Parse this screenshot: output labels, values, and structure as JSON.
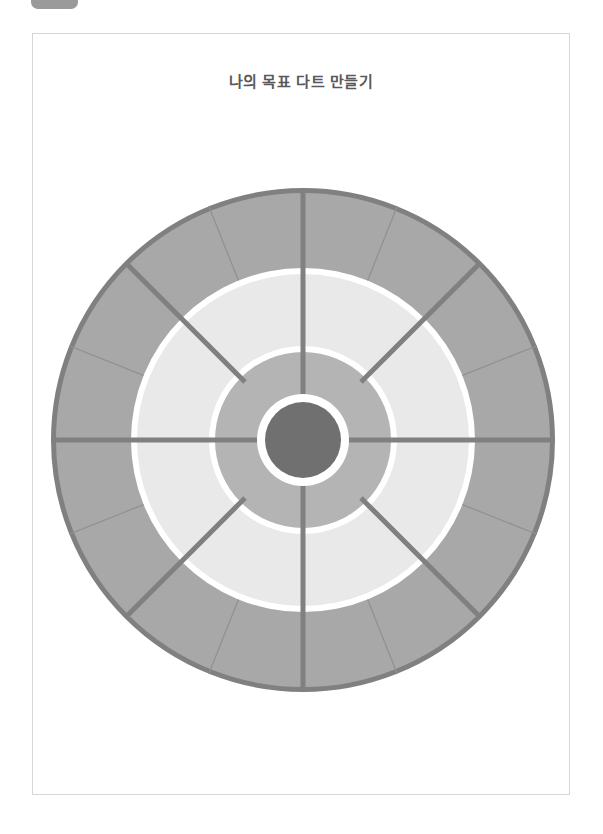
{
  "window": {
    "background_color": "#ffffff",
    "top_chrome_color": "#9a9a9a"
  },
  "page": {
    "title": "나의 목표 다트 만들기",
    "border_color": "#d6d6d6",
    "background_color": "#ffffff"
  },
  "dartboard": {
    "name": "goal-dart-target",
    "center": {
      "x": 252,
      "y": 252
    },
    "outer_radius": 252,
    "rings": [
      {
        "name": "outer-segments-ring",
        "inner_radius": 172,
        "outer_radius": 249,
        "fill": "#a8a8a8",
        "segments": 12
      },
      {
        "name": "white-separator-ring-outer",
        "inner_radius": 166,
        "outer_radius": 172,
        "fill": "#ffffff"
      },
      {
        "name": "light-ring",
        "inner_radius": 94,
        "outer_radius": 166,
        "fill": "#e9e9e9"
      },
      {
        "name": "white-separator-ring-inner",
        "inner_radius": 88,
        "outer_radius": 94,
        "fill": "#ffffff"
      },
      {
        "name": "medium-ring",
        "inner_radius": 46,
        "outer_radius": 88,
        "fill": "#b4b4b4"
      },
      {
        "name": "white-separator-ring-center",
        "inner_radius": 38,
        "outer_radius": 46,
        "fill": "#ffffff"
      },
      {
        "name": "bullseye",
        "inner_radius": 0,
        "outer_radius": 38,
        "fill": "#707070"
      }
    ],
    "outline_color": "#808080",
    "outline_width": 5,
    "spoke_color": "#808080",
    "spoke_width": 5,
    "thin_divider_color": "#909090",
    "thin_divider_width": 1,
    "major_spokes_deg": [
      0,
      45,
      90,
      135,
      180,
      225,
      270,
      315
    ],
    "full_spokes_deg": [
      0,
      90,
      180,
      270
    ],
    "short_spokes_deg": [
      45,
      135,
      225,
      315
    ],
    "short_spoke_inner_radius": 82,
    "thin_dividers_deg": [
      22.5,
      67.5,
      112.5,
      157.5,
      202.5,
      247.5,
      292.5,
      337.5
    ]
  }
}
